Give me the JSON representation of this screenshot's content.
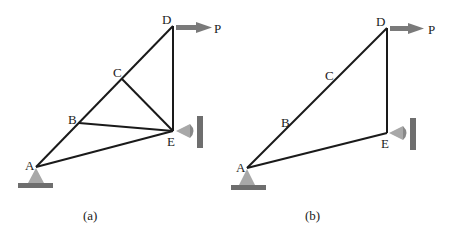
{
  "figures": [
    {
      "caption": "(a)",
      "nodes": {
        "A": "A",
        "B": "B",
        "C": "C",
        "D": "D",
        "E": "E"
      },
      "load_label": "P",
      "members": [
        "A-B",
        "B-C",
        "C-D",
        "D-E",
        "C-E",
        "B-E",
        "A-E"
      ]
    },
    {
      "caption": "(b)",
      "nodes": {
        "A": "A",
        "B": "B",
        "C": "C",
        "D": "D",
        "E": "E"
      },
      "load_label": "P",
      "members": [
        "A-D",
        "D-E",
        "A-E"
      ]
    }
  ],
  "colors": {
    "member": "#1a1a1a",
    "support": "#a8a8a8",
    "ground": "#6e6e6e",
    "arrow": "#7a7a7a"
  }
}
